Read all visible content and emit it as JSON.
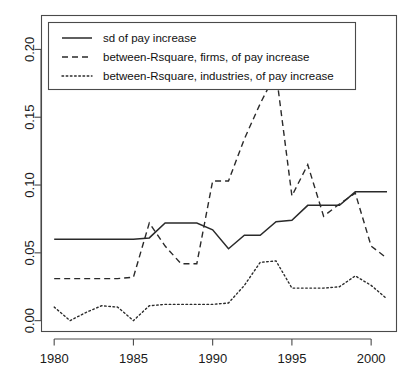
{
  "chart_data": {
    "type": "line",
    "title": "",
    "xlabel": "",
    "ylabel": "",
    "xlim": [
      1979.2,
      2001.6
    ],
    "ylim": [
      -0.008,
      0.225
    ],
    "grid": false,
    "legend_position": "top",
    "x_ticks": [
      1980,
      1985,
      1990,
      1995,
      2000
    ],
    "x_tick_labels": [
      "1980",
      "1985",
      "1990",
      "1995",
      "2000"
    ],
    "y_ticks": [
      0.0,
      0.05,
      0.1,
      0.15,
      0.2
    ],
    "y_tick_labels": [
      "0.00",
      "0.05",
      "0.10",
      "0.15",
      "0.20"
    ],
    "x": [
      1980,
      1981,
      1982,
      1983,
      1984,
      1985,
      1986,
      1987,
      1988,
      1989,
      1990,
      1991,
      1992,
      1993,
      1994,
      1995,
      1996,
      1997,
      1998,
      1999,
      2000,
      2001
    ],
    "series": [
      {
        "name": "sd of pay increase",
        "style": "solid",
        "color": "#2a2a2a",
        "values": [
          0.06,
          0.06,
          0.06,
          0.06,
          0.06,
          0.06,
          0.061,
          0.072,
          0.072,
          0.072,
          0.067,
          0.053,
          0.063,
          0.063,
          0.073,
          0.074,
          0.085,
          0.085,
          0.085,
          0.095,
          0.095,
          0.095
        ]
      },
      {
        "name": "between-Rsquare, firms, of pay increase",
        "style": "dashed",
        "color": "#2a2a2a",
        "values": [
          0.031,
          0.031,
          0.031,
          0.031,
          0.031,
          0.032,
          0.072,
          0.055,
          0.042,
          0.042,
          0.103,
          0.103,
          0.134,
          0.16,
          0.183,
          0.092,
          0.115,
          0.077,
          0.086,
          0.094,
          0.055,
          0.046
        ]
      },
      {
        "name": "between-Rsquare, industries, of pay increase",
        "style": "dotted",
        "color": "#6f6f6f",
        "values": [
          0.01,
          0.0,
          0.006,
          0.011,
          0.01,
          0.0,
          0.011,
          0.012,
          0.012,
          0.012,
          0.012,
          0.013,
          0.026,
          0.043,
          0.044,
          0.024,
          0.024,
          0.024,
          0.025,
          0.033,
          0.026,
          0.016
        ]
      }
    ]
  },
  "legend": {
    "entries": [
      {
        "label": "sd of pay increase",
        "style": "solid"
      },
      {
        "label": "between-Rsquare, firms, of pay increase",
        "style": "dashed"
      },
      {
        "label": "between-Rsquare, industries, of pay increase",
        "style": "dotted"
      }
    ]
  }
}
